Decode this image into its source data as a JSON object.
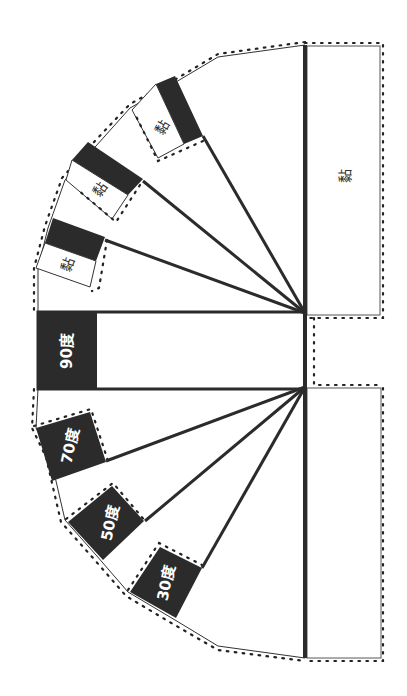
{
  "diagram": {
    "title": "",
    "colors": {
      "ink": "#2b2b2b",
      "paper": "#ffffff",
      "dot": "#222222"
    },
    "panel_label": "黏",
    "angle_labels": {
      "a90": "90度",
      "a70": "70度",
      "a50": "50度",
      "a30": "30度"
    },
    "flap_labels": {
      "f1": "黏",
      "f2": "黏",
      "f3": "黏"
    }
  }
}
